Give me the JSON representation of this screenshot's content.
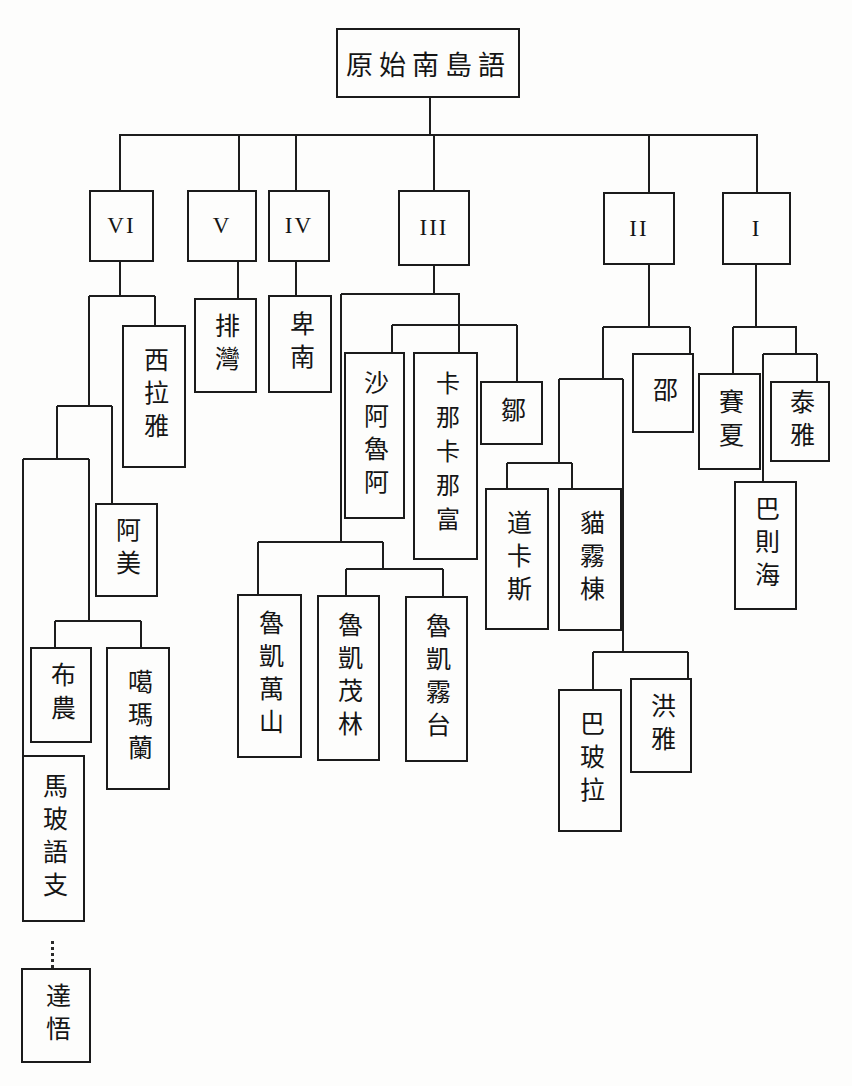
{
  "diagram": {
    "root_label": "原始南島語",
    "branch_numerals": [
      "VI",
      "V",
      "IV",
      "III",
      "II",
      "I"
    ],
    "structure": {
      "I": "(賽夏, (巴則海, 泰雅))",
      "II": "(((道卡斯, 貓霧棟), (巴玻拉, 洪雅)), 邵)",
      "III": "((魯凱萬山, (魯凱茂林, 魯凱霧台)), (沙阿魯阿, 卡那卡那富, 鄒))",
      "IV": "卑南",
      "V": "排灣",
      "VI": "(((馬玻語支, (布農, 噶瑪蘭)), 阿美), 西拉雅)",
      "dotted_link": "馬玻語支 ⇢ 達悟"
    },
    "line_color": "#1d1d1d"
  },
  "nodes": {
    "root": {
      "label": "原始南島語"
    },
    "vi": {
      "label": "VI"
    },
    "v": {
      "label": "V"
    },
    "iv": {
      "label": "IV"
    },
    "iii": {
      "label": "III"
    },
    "ii": {
      "label": "II"
    },
    "i": {
      "label": "I"
    },
    "siraya": {
      "label": "西拉雅"
    },
    "paiwan": {
      "label": "排灣"
    },
    "puyuma": {
      "label": "卑南"
    },
    "amis": {
      "label": "阿美"
    },
    "bunun": {
      "label": "布農"
    },
    "kavalan": {
      "label": "噶瑪蘭"
    },
    "malayo": {
      "label": "馬玻語支"
    },
    "tao": {
      "label": "達悟"
    },
    "saaroa": {
      "label": "沙阿魯阿"
    },
    "kanakanavu": {
      "label": "卡那卡那富"
    },
    "tsou": {
      "label": "鄒"
    },
    "rukai_wanshan": {
      "label": "魯凱萬山"
    },
    "rukai_maolin": {
      "label": "魯凱茂林"
    },
    "rukai_wutai": {
      "label": "魯凱霧台"
    },
    "thao": {
      "label": "邵"
    },
    "taokas": {
      "label": "道卡斯"
    },
    "babuza": {
      "label": "貓霧棟"
    },
    "papora": {
      "label": "巴玻拉"
    },
    "hoanya": {
      "label": "洪雅"
    },
    "saisiyat": {
      "label": "賽夏"
    },
    "atayal": {
      "label": "泰雅"
    },
    "pazeh": {
      "label": "巴則海"
    }
  }
}
